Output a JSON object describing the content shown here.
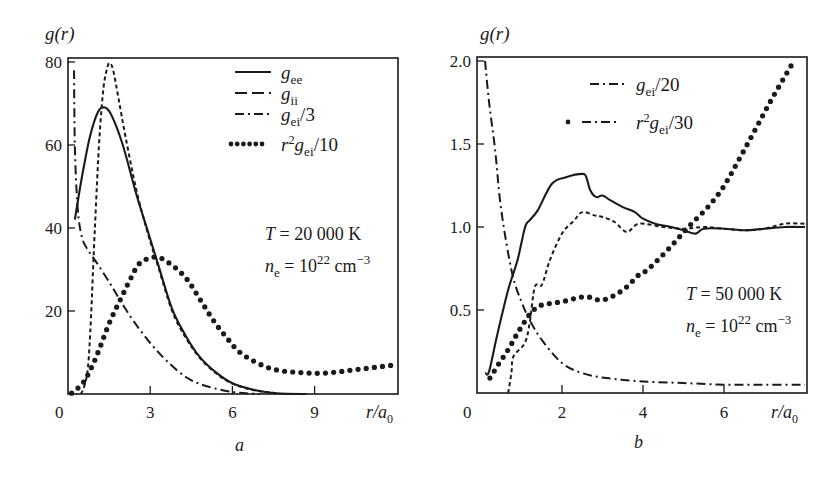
{
  "chart_data": [
    {
      "panel_label": "a",
      "type": "line",
      "ylabel": "g(r)",
      "xlabel": "r/a0",
      "xlim": [
        0,
        11.9
      ],
      "ylim": [
        0,
        80
      ],
      "xticks": [
        0,
        3,
        6,
        9
      ],
      "yticks": [
        20,
        40,
        60,
        80
      ],
      "x_tick_labels": [
        "0",
        "3",
        "6",
        "9"
      ],
      "y_tick_labels": [
        "20",
        "40",
        "60",
        "80"
      ],
      "grid": false,
      "legend": [
        {
          "label_main": "g",
          "label_sub": "ee",
          "label_tail": "",
          "style": "solid"
        },
        {
          "label_main": "g",
          "label_sub": "ii",
          "label_tail": "",
          "style": "longdash"
        },
        {
          "label_main": "g",
          "label_sub": "ei",
          "label_tail": "/3",
          "style": "dashdot"
        },
        {
          "label_pre": "r",
          "label_sup": "2",
          "label_main": "g",
          "label_sub": "ei",
          "label_tail": "/10",
          "style": "dotted"
        }
      ],
      "annotations": {
        "temperature": "T = 20 000 K",
        "density_prefix": "n",
        "density_sub": "e",
        "density_eq": " = 10",
        "density_exp": "22",
        "density_unit": " cm",
        "density_unit_exp": "−3"
      },
      "series": [
        {
          "name": "g_ee",
          "style": "solid",
          "x": [
            0.25,
            0.5,
            0.8,
            1.1,
            1.35,
            1.6,
            2.0,
            2.5,
            2.9,
            3.3,
            3.8,
            4.3,
            4.8,
            5.4,
            6.0,
            6.8,
            7.6,
            8.7
          ],
          "y": [
            42,
            52,
            62,
            68,
            69,
            67,
            60,
            48,
            39.5,
            31,
            20.5,
            14,
            9,
            5.2,
            2.6,
            1.0,
            0.2,
            0
          ]
        },
        {
          "name": "g_ii",
          "style": "shortdash",
          "x": [
            0.47,
            0.6,
            0.73,
            0.84,
            0.98,
            1.15,
            1.3,
            1.45,
            1.53,
            1.65,
            1.85,
            2.1,
            2.5,
            2.9,
            3.3,
            3.8,
            4.3,
            4.8,
            5.4,
            6.0,
            6.8,
            7.6
          ],
          "y": [
            0,
            2,
            6.5,
            18.6,
            40,
            62,
            74,
            79,
            79.7,
            78,
            71,
            62,
            49,
            39,
            30.5,
            20,
            13.5,
            8.8,
            5.0,
            2.5,
            0.9,
            0.2
          ]
        },
        {
          "name": "g_ei/3",
          "style": "dashdot",
          "x": [
            0.22,
            0.25,
            0.35,
            0.5,
            0.7,
            1.05,
            1.5,
            1.9,
            2.4,
            3.0,
            3.6,
            4.3,
            5.0,
            6.0,
            7.0
          ],
          "y": [
            78,
            60,
            45,
            38,
            35,
            31.6,
            27,
            22.6,
            17.5,
            12.3,
            8.0,
            4.1,
            2.0,
            0.5,
            0
          ]
        },
        {
          "name": "r^2 g_ei/10",
          "style": "dotted",
          "x": [
            0.13,
            0.55,
            0.9,
            1.17,
            1.5,
            1.9,
            2.3,
            2.63,
            3.2,
            3.7,
            4.3,
            4.8,
            5.3,
            5.8,
            6.3,
            7.0,
            7.6,
            8.4,
            9.2,
            9.8,
            10.4,
            11.2,
            11.9
          ],
          "y": [
            0.2,
            2.7,
            7,
            11.3,
            17,
            22.6,
            28,
            31.6,
            33,
            31.5,
            28,
            23,
            17.8,
            13.5,
            9.9,
            7.2,
            5.8,
            5.2,
            5.0,
            5.3,
            5.8,
            6.4,
            7.0
          ]
        }
      ]
    },
    {
      "panel_label": "b",
      "type": "line",
      "ylabel": "g(r)",
      "xlabel": "r/a0",
      "xlim": [
        -0.1,
        8.04
      ],
      "ylim": [
        0,
        2.0
      ],
      "xticks": [
        0,
        2,
        4,
        6
      ],
      "yticks": [
        0.5,
        1.0,
        1.5,
        2.0
      ],
      "x_tick_labels": [
        "0",
        "2",
        "4",
        "6"
      ],
      "y_tick_labels": [
        "0.5",
        "1.0",
        "1.5",
        "2.0"
      ],
      "grid": false,
      "legend": [
        {
          "label_main": "g",
          "label_sub": "ei",
          "label_tail": "/20",
          "style": "dashdot"
        },
        {
          "label_pre": "r",
          "label_sup": "2",
          "label_main": "g",
          "label_sub": "ei",
          "label_tail": "/30",
          "style": "dot-dashdot"
        }
      ],
      "annotations": {
        "temperature": "T = 50 000 K",
        "density_prefix": "n",
        "density_sub": "e",
        "density_eq": " = 10",
        "density_exp": "22",
        "density_unit": " cm",
        "density_unit_exp": "−3"
      },
      "series": [
        {
          "name": "g_ee",
          "style": "solid",
          "x": [
            0.1,
            0.2,
            0.4,
            0.67,
            0.9,
            1.09,
            1.2,
            1.4,
            1.75,
            2.1,
            2.5,
            2.6,
            2.7,
            2.85,
            3.0,
            3.2,
            3.5,
            3.8,
            4.0,
            4.3,
            4.7,
            5.0,
            5.3,
            5.5,
            6.0,
            6.5,
            7.0,
            7.5,
            8.0
          ],
          "y": [
            0.12,
            0.13,
            0.35,
            0.62,
            0.8,
            1.0,
            1.04,
            1.1,
            1.26,
            1.3,
            1.32,
            1.3,
            1.22,
            1.18,
            1.19,
            1.16,
            1.12,
            1.09,
            1.05,
            1.02,
            1.0,
            0.98,
            0.96,
            0.99,
            0.99,
            0.98,
            0.99,
            1.0,
            1.0
          ]
        },
        {
          "name": "g_ii",
          "style": "shortdash",
          "x": [
            0.67,
            0.75,
            0.8,
            1.08,
            1.2,
            1.33,
            1.5,
            1.7,
            2.0,
            2.3,
            2.5,
            2.8,
            3.0,
            3.3,
            3.6,
            3.9,
            4.5,
            5.0,
            5.5,
            6.0,
            6.5,
            7.0,
            7.5,
            8.0
          ],
          "y": [
            0,
            0.12,
            0.22,
            0.3,
            0.42,
            0.64,
            0.65,
            0.8,
            0.96,
            1.04,
            1.09,
            1.07,
            1.06,
            1.03,
            0.97,
            1.02,
            1.0,
            0.99,
            1.0,
            0.99,
            0.98,
            0.99,
            1.02,
            1.02
          ]
        },
        {
          "name": "g_ei/20",
          "style": "dashdot",
          "x": [
            0.1,
            0.2,
            0.35,
            0.5,
            0.77,
            1.0,
            1.2,
            1.5,
            2.0,
            2.5,
            3.1,
            4.0,
            5.0,
            6.0,
            7.0,
            8.0
          ],
          "y": [
            2.0,
            1.75,
            1.46,
            1.1,
            0.72,
            0.55,
            0.44,
            0.32,
            0.18,
            0.12,
            0.09,
            0.07,
            0.06,
            0.05,
            0.05,
            0.05
          ]
        },
        {
          "name": "r^2 g_ei/30",
          "style": "dotted",
          "x": [
            0.22,
            0.45,
            0.67,
            0.9,
            1.16,
            1.3,
            1.5,
            2.0,
            2.57,
            3.0,
            3.5,
            3.93,
            4.1,
            4.6,
            5.16,
            5.6,
            5.98,
            6.4,
            6.8,
            7.2,
            7.7
          ],
          "y": [
            0.09,
            0.18,
            0.26,
            0.36,
            0.46,
            0.5,
            0.53,
            0.55,
            0.58,
            0.56,
            0.62,
            0.72,
            0.74,
            0.86,
            1.01,
            1.12,
            1.24,
            1.42,
            1.6,
            1.78,
            1.99
          ]
        }
      ]
    }
  ],
  "figure": {
    "panel_a_caption": "a",
    "panel_b_caption": "b",
    "y_axis_title": "g(r)",
    "x_axis_title_main": "r/a",
    "x_axis_title_sub": "0",
    "origin_label": "0"
  }
}
